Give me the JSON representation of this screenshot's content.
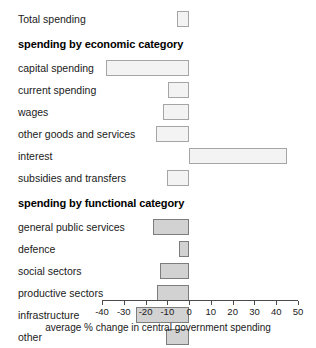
{
  "chart_data": {
    "type": "bar",
    "orientation": "horizontal",
    "title": "",
    "xlabel": "average % change in central government spending",
    "ylabel": "",
    "xlim": [
      -40,
      50
    ],
    "xticks": [
      -40,
      -30,
      -20,
      -10,
      0,
      10,
      20,
      30,
      40,
      50
    ],
    "xtick_labels": [
      "-40",
      "-30",
      "-20",
      "-10",
      "0",
      "10",
      "20",
      "30",
      "40",
      "50"
    ],
    "grid": false,
    "legend": null,
    "zero_line": 0,
    "sections": [
      {
        "heading": "",
        "style": "light",
        "categories": [
          "Total spending"
        ],
        "values": [
          -5.4
        ]
      },
      {
        "heading": "spending by economic category",
        "style": "light",
        "categories": [
          "capital spending",
          "current spending",
          "wages",
          "other goods and services",
          "interest",
          "subsidies and transfers"
        ],
        "values": [
          -38.0,
          -9.7,
          -12.0,
          -15.3,
          45.0,
          -10.2
        ]
      },
      {
        "heading": "spending by functional category",
        "style": "dark",
        "categories": [
          "general public services",
          "defence",
          "social sectors",
          "productive sectors",
          "infrastructure",
          "other"
        ],
        "values": [
          -16.7,
          -4.6,
          -13.4,
          -14.8,
          -24.5,
          -10.6
        ]
      }
    ]
  },
  "colors": {
    "light_fill": "#f3f3f3",
    "light_border": "#a5a5a5",
    "dark_fill": "#d2d2d2",
    "dark_border": "#7d7d7d",
    "axis": "#4a4a4a",
    "text": "#1a1a1a",
    "background": "#ffffff"
  }
}
